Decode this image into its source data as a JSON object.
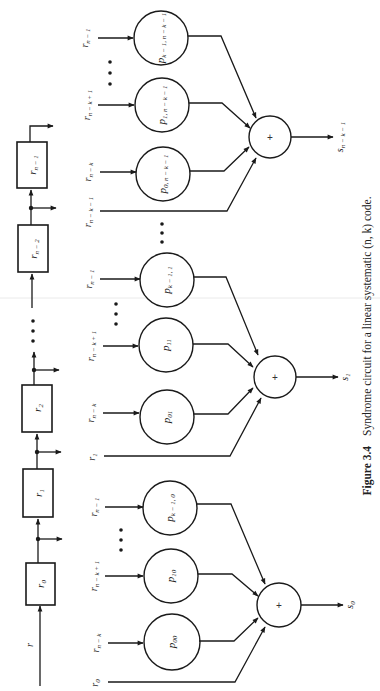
{
  "figure": {
    "caption_number": "Figure 3.4",
    "caption_text": "Syndrome circuit for a linear systematic (n, k) code.",
    "orientation": "rotated 90° counter-clockwise"
  },
  "shift_register": {
    "input_label": "r",
    "stages": [
      "r0",
      "r1",
      "r2",
      "rn−2",
      "rn−1"
    ],
    "stage_display": [
      {
        "base": "r",
        "sub": "0"
      },
      {
        "base": "r",
        "sub": "1"
      },
      {
        "base": "r",
        "sub": "2"
      },
      {
        "base": "r",
        "sub": "n − 2"
      },
      {
        "base": "r",
        "sub": "n − 1"
      }
    ],
    "ellipsis": "• • •"
  },
  "syndrome_groups": [
    {
      "output": {
        "base": "s",
        "sub": "0"
      },
      "direct_input": {
        "base": "r",
        "sub": "0"
      },
      "multipliers": [
        {
          "input": {
            "base": "r",
            "sub": "n − k"
          },
          "coef": {
            "base": "p",
            "sub": "00"
          }
        },
        {
          "input": {
            "base": "r",
            "sub": "n − k + 1"
          },
          "coef": {
            "base": "p",
            "sub": "10"
          }
        },
        {
          "input": {
            "base": "r",
            "sub": "n − 1"
          },
          "coef": {
            "base": "p",
            "sub": "k − 1, 0"
          }
        }
      ],
      "adder_symbol": "+"
    },
    {
      "output": {
        "base": "s",
        "sub": "1"
      },
      "direct_input": {
        "base": "r",
        "sub": "1"
      },
      "multipliers": [
        {
          "input": {
            "base": "r",
            "sub": "n − k"
          },
          "coef": {
            "base": "p",
            "sub": "01"
          }
        },
        {
          "input": {
            "base": "r",
            "sub": "n − k + 1"
          },
          "coef": {
            "base": "p",
            "sub": "11"
          }
        },
        {
          "input": {
            "base": "r",
            "sub": "n − 1"
          },
          "coef": {
            "base": "p",
            "sub": "k − 1, 1"
          }
        }
      ],
      "adder_symbol": "+"
    },
    {
      "output": {
        "base": "s",
        "sub": "n − k − 1"
      },
      "direct_input": {
        "base": "r",
        "sub": "n − k − 1"
      },
      "multipliers": [
        {
          "input": {
            "base": "r",
            "sub": "n − k"
          },
          "coef": {
            "base": "p",
            "sub": "0, n − k − 1"
          }
        },
        {
          "input": {
            "base": "r",
            "sub": "n − k + 1"
          },
          "coef": {
            "base": "p",
            "sub": "1, n − k − 1"
          }
        },
        {
          "input": {
            "base": "r",
            "sub": "n − 1"
          },
          "coef": {
            "base": "p",
            "sub": "k − 1, n − k − 1"
          }
        }
      ],
      "adder_symbol": "+"
    }
  ],
  "ellipsis_glyph": "• • •"
}
